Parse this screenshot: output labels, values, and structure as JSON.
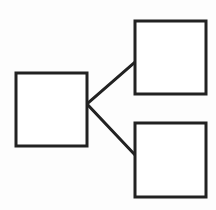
{
  "diagram": {
    "type": "tree",
    "stroke_color": "#222222",
    "fill_color": "#ffffff",
    "stroke_width": 3,
    "nodes": [
      {
        "id": "root",
        "label": "",
        "x": 16,
        "y": 73,
        "w": 71,
        "h": 73
      },
      {
        "id": "child-top",
        "label": "",
        "x": 135,
        "y": 21,
        "w": 71,
        "h": 73
      },
      {
        "id": "child-bottom",
        "label": "",
        "x": 135,
        "y": 123,
        "w": 71,
        "h": 74
      }
    ],
    "edges": [
      {
        "from": "root",
        "to": "child-top",
        "x1": 87,
        "y1": 104,
        "x2": 135,
        "y2": 62
      },
      {
        "from": "root",
        "to": "child-bottom",
        "x1": 87,
        "y1": 104,
        "x2": 135,
        "y2": 155
      }
    ]
  }
}
